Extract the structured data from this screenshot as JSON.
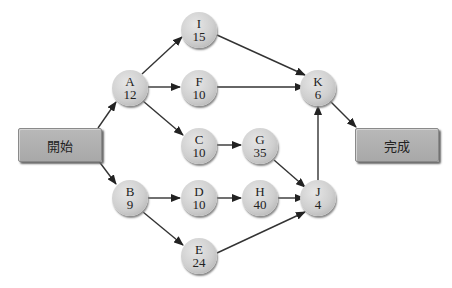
{
  "diagram": {
    "start_label": "開始",
    "end_label": "完成",
    "nodes": {
      "A": {
        "id": "A",
        "duration": "12"
      },
      "B": {
        "id": "B",
        "duration": "9"
      },
      "C": {
        "id": "C",
        "duration": "10"
      },
      "D": {
        "id": "D",
        "duration": "10"
      },
      "E": {
        "id": "E",
        "duration": "24"
      },
      "F": {
        "id": "F",
        "duration": "10"
      },
      "G": {
        "id": "G",
        "duration": "35"
      },
      "H": {
        "id": "H",
        "duration": "40"
      },
      "I": {
        "id": "I",
        "duration": "15"
      },
      "J": {
        "id": "J",
        "duration": "4"
      },
      "K": {
        "id": "K",
        "duration": "6"
      }
    },
    "edges": [
      [
        "Start",
        "A"
      ],
      [
        "Start",
        "B"
      ],
      [
        "A",
        "I"
      ],
      [
        "A",
        "F"
      ],
      [
        "A",
        "C"
      ],
      [
        "I",
        "K"
      ],
      [
        "F",
        "K"
      ],
      [
        "C",
        "G"
      ],
      [
        "G",
        "J"
      ],
      [
        "B",
        "D"
      ],
      [
        "B",
        "E"
      ],
      [
        "D",
        "H"
      ],
      [
        "H",
        "J"
      ],
      [
        "E",
        "J"
      ],
      [
        "J",
        "K"
      ],
      [
        "K",
        "End"
      ]
    ]
  }
}
